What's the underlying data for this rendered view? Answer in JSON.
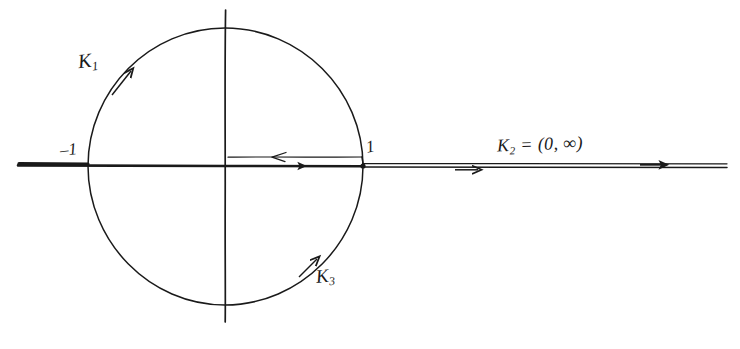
{
  "figure": {
    "kind": "contour-diagram",
    "background_color": "#ffffff",
    "ink_color": "#1a1a1a"
  },
  "labels": {
    "k1": {
      "base": "K",
      "sub": "1",
      "full": "K1"
    },
    "k3": {
      "base": "K",
      "sub": "3",
      "full": "K3"
    },
    "k2": {
      "base": "K",
      "sub": "2",
      "rest": " = (0, ∞)",
      "full": "K2 = (0, ∞)"
    },
    "minus_one": "–1",
    "plus_one": "1"
  },
  "geometry": {
    "circle": {
      "cx": 225,
      "cy": 166,
      "r": 138
    },
    "axis_horizontal": {
      "x1": 18,
      "x2": 727,
      "y": 166
    },
    "axis_vertical": {
      "x": 225,
      "y1": 10,
      "y2": 322
    },
    "left_intersection_x": 88,
    "right_intersection_x": 363,
    "ray_right": {
      "x1": 363,
      "x2": 727,
      "y": 166
    },
    "segment_zero_one": {
      "x1": 228,
      "x2": 363,
      "y": 157
    }
  },
  "arrows": [
    {
      "name": "k1-arc-arrow",
      "on": "circle-upper-left",
      "direction": "counterclockwise-upward",
      "x": 124,
      "y": 76
    },
    {
      "name": "k3-arc-arrow",
      "on": "circle-lower-right",
      "direction": "counterclockwise-upward",
      "x": 311,
      "y": 264
    },
    {
      "name": "segment-arrow-left",
      "on": "segment-zero-one-upper",
      "direction": "left",
      "x": 275,
      "y": 157
    },
    {
      "name": "segment-arrow-right",
      "on": "axis-zero-one",
      "direction": "right",
      "x": 300,
      "y": 166
    },
    {
      "name": "ray-arrow-near",
      "on": "ray-right",
      "direction": "right",
      "x": 470,
      "y": 170
    },
    {
      "name": "ray-arrow-far",
      "on": "ray-right",
      "direction": "right",
      "x": 655,
      "y": 166
    }
  ]
}
